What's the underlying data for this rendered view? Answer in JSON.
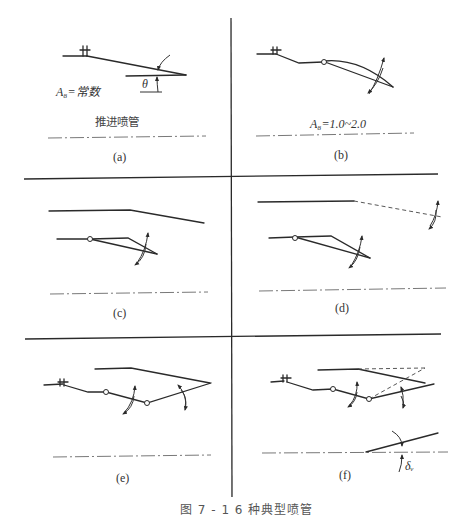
{
  "figure": {
    "caption": "图 7 - 1   6 种典型喷管",
    "panels": [
      {
        "id": "a",
        "label": "(a)",
        "annotation": "A₈=常数",
        "description": "推进喷管",
        "angle_symbol": "θ"
      },
      {
        "id": "b",
        "label": "(b)",
        "annotation": "A₈=1.0~2.0"
      },
      {
        "id": "c",
        "label": "(c)"
      },
      {
        "id": "d",
        "label": "(d)"
      },
      {
        "id": "e",
        "label": "(e)"
      },
      {
        "id": "f",
        "label": "(f)",
        "angle_symbol": "δᵥ"
      }
    ]
  },
  "colors": {
    "line": "#2a2a2a",
    "background": "#ffffff"
  }
}
